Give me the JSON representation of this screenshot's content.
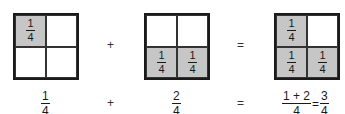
{
  "diagram": {
    "boxes": [
      {
        "id": "one-quarter",
        "cells": [
          {
            "shaded": true,
            "label": {
              "num": "1",
              "den": "4"
            }
          },
          {
            "shaded": false,
            "label": null
          },
          {
            "shaded": false,
            "label": null
          },
          {
            "shaded": false,
            "label": null
          }
        ],
        "caption": {
          "num": "1",
          "den": "4"
        }
      },
      {
        "id": "two-quarters",
        "cells": [
          {
            "shaded": false,
            "label": null
          },
          {
            "shaded": false,
            "label": null
          },
          {
            "shaded": true,
            "label": {
              "num": "1",
              "den": "4"
            }
          },
          {
            "shaded": true,
            "label": {
              "num": "1",
              "den": "4"
            }
          }
        ],
        "caption": {
          "num": "2",
          "den": "4"
        }
      },
      {
        "id": "three-quarters",
        "cells": [
          {
            "shaded": true,
            "label": {
              "num": "1",
              "den": "4"
            }
          },
          {
            "shaded": false,
            "label": null
          },
          {
            "shaded": true,
            "label": {
              "num": "1",
              "den": "4"
            }
          },
          {
            "shaded": true,
            "label": {
              "num": "1",
              "den": "4"
            }
          }
        ],
        "caption": {
          "num": "1 + 2",
          "den": "4",
          "equals": "=",
          "result_num": "3",
          "result_den": "4"
        }
      }
    ],
    "operators": {
      "plus": "+",
      "equals": "="
    },
    "colors": {
      "shaded": "#c6c6c6",
      "line": "#1a1a1a",
      "background": "#ffffff"
    }
  }
}
